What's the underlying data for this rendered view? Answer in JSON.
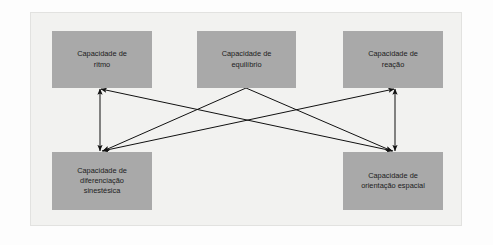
{
  "diagram": {
    "frame": {
      "bg": "#f2f2f0",
      "border": "#e2e2e0"
    },
    "node_fill": "#a9a9a9",
    "link_color": "#111111",
    "nodes": [
      {
        "id": "ritmo",
        "label": "Capacidade de ritmo",
        "lines": [
          "Capacidade de",
          "ritmo"
        ],
        "x": 52,
        "y": 31,
        "w": 100,
        "h": 57
      },
      {
        "id": "equilibrio",
        "label": "Capacidade de equilíbrio",
        "lines": [
          "Capacidade de",
          "equilíbrio"
        ],
        "x": 197,
        "y": 31,
        "w": 99,
        "h": 57
      },
      {
        "id": "reacao",
        "label": "Capacidade de reação",
        "lines": [
          "Capacidade de",
          "reação"
        ],
        "x": 343,
        "y": 31,
        "w": 100,
        "h": 57
      },
      {
        "id": "diferenciacao",
        "label": "Capacidade de diferenciação sinestésica",
        "lines": [
          "Capacidade de",
          "diferenciação",
          "sinestésica"
        ],
        "x": 52,
        "y": 152,
        "w": 100,
        "h": 58
      },
      {
        "id": "orientacao",
        "label": "Capacidade de orientação espacial",
        "lines": [
          "Capacidade de",
          "orientação espacial"
        ],
        "x": 343,
        "y": 152,
        "w": 100,
        "h": 58
      }
    ],
    "links": [
      {
        "id": "ritmo-diferenciacao",
        "from": "ritmo",
        "to": "diferenciacao",
        "x1": 100,
        "y1": 89,
        "x2": 100,
        "y2": 151,
        "arrows": "both"
      },
      {
        "id": "reacao-orientacao",
        "from": "reacao",
        "to": "orientacao",
        "x1": 395,
        "y1": 89,
        "x2": 395,
        "y2": 151,
        "arrows": "both"
      },
      {
        "id": "ritmo-orientacao",
        "from": "ritmo",
        "to": "orientacao",
        "x1": 101,
        "y1": 89,
        "x2": 393,
        "y2": 151,
        "arrows": "both"
      },
      {
        "id": "reacao-diferenciacao",
        "from": "reacao",
        "to": "diferenciacao",
        "x1": 394,
        "y1": 89,
        "x2": 102,
        "y2": 151,
        "arrows": "both"
      },
      {
        "id": "equilibrio-diferenciacao",
        "from": "equilibrio",
        "to": "diferenciacao",
        "x1": 246,
        "y1": 88,
        "x2": 103,
        "y2": 151,
        "arrows": "end"
      },
      {
        "id": "equilibrio-orientacao",
        "from": "equilibrio",
        "to": "orientacao",
        "x1": 246,
        "y1": 88,
        "x2": 392,
        "y2": 151,
        "arrows": "end"
      }
    ]
  }
}
